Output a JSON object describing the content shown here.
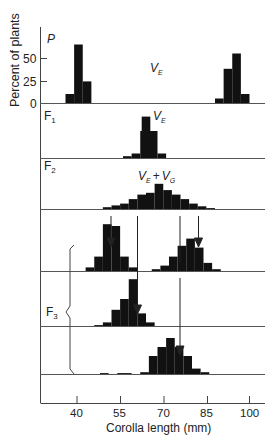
{
  "chart_data": {
    "type": "bar",
    "title": "",
    "xlabel": "Corolla length (mm)",
    "ylabel": "Percent of plants",
    "xlim": [
      21,
      106
    ],
    "x_ticks": [
      40,
      55,
      70,
      85,
      100
    ],
    "y_ticks": [
      0,
      25,
      50
    ],
    "y_scale_px_per_pct": 0.9,
    "colors": {
      "bars": "#111111",
      "axis": "#444444",
      "text": "#222222"
    },
    "panels": [
      {
        "label": "P",
        "annotation": "V_E",
        "annotation_pos": [
          66,
          68
        ],
        "baseline_y": 103,
        "series": [
          {
            "name": "P1",
            "bins": [
              [
                36,
                39,
                10
              ],
              [
                39,
                42,
                65
              ],
              [
                42,
                45,
                24
              ]
            ]
          },
          {
            "name": "P2",
            "bins": [
              [
                88,
                91,
                5
              ],
              [
                91,
                94,
                38
              ],
              [
                94,
                97,
                55
              ],
              [
                97,
                100,
                10
              ]
            ]
          }
        ]
      },
      {
        "label": "F1",
        "annotation": "V_E",
        "annotation_pos": [
          70,
          120
        ],
        "baseline_y": 158,
        "series": [
          {
            "name": "F1",
            "bins": [
              [
                56,
                59,
                2
              ],
              [
                59,
                62,
                5
              ],
              [
                62,
                65,
                30
              ],
              [
                65,
                68,
                30
              ],
              [
                68,
                71,
                5
              ]
            ]
          }
        ],
        "center_bin": [
          62.5,
          65.5,
          46
        ]
      },
      {
        "label": "F2",
        "annotation": "V_E + V_G",
        "annotation_pos": [
          66,
          172
        ],
        "baseline_y": 209,
        "series": [
          {
            "name": "F2",
            "bins": [
              [
                49,
                52,
                2
              ],
              [
                52,
                55,
                4
              ],
              [
                55,
                58,
                6
              ],
              [
                58,
                61,
                11
              ],
              [
                61,
                64,
                16
              ],
              [
                64,
                67,
                18
              ],
              [
                67,
                70,
                28
              ],
              [
                70,
                73,
                21
              ],
              [
                73,
                76,
                16
              ],
              [
                76,
                79,
                11
              ],
              [
                79,
                82,
                6
              ],
              [
                82,
                85,
                3
              ],
              [
                85,
                88,
                1
              ]
            ]
          }
        ]
      },
      {
        "label": "",
        "baseline_y": 271,
        "series": [
          {
            "name": "F3a-low",
            "bins": [
              [
                43,
                46,
                4
              ],
              [
                46,
                49,
                16
              ],
              [
                49,
                52,
                52
              ],
              [
                52,
                55,
                50
              ],
              [
                55,
                58,
                16
              ],
              [
                58,
                61,
                4
              ]
            ]
          },
          {
            "name": "F3a-high",
            "bins": [
              [
                66,
                69,
                2
              ],
              [
                69,
                72,
                6
              ],
              [
                72,
                75,
                16
              ],
              [
                75,
                78,
                28
              ],
              [
                78,
                81,
                36
              ],
              [
                81,
                84,
                26
              ],
              [
                84,
                87,
                9
              ],
              [
                87,
                90,
                2
              ]
            ]
          }
        ]
      },
      {
        "label": "F3",
        "baseline_y": 326,
        "series": [
          {
            "name": "F3b",
            "bins": [
              [
                46,
                49,
                1
              ],
              [
                49,
                52,
                4
              ],
              [
                52,
                55,
                18
              ],
              [
                55,
                58,
                30
              ],
              [
                58,
                61,
                52
              ],
              [
                61,
                64,
                14
              ],
              [
                64,
                67,
                4
              ]
            ]
          }
        ]
      },
      {
        "label": "",
        "baseline_y": 374,
        "series": [
          {
            "name": "F3c",
            "bins": [
              [
                48,
                51,
                1
              ],
              [
                54,
                59,
                1
              ],
              [
                62,
                65,
                2
              ],
              [
                65,
                68,
                20
              ],
              [
                68,
                71,
                30
              ],
              [
                71,
                74,
                40
              ],
              [
                74,
                77,
                30
              ],
              [
                77,
                80,
                20
              ],
              [
                80,
                83,
                6
              ],
              [
                83,
                86,
                2
              ]
            ]
          }
        ]
      }
    ],
    "arrows": [
      {
        "x": 50,
        "from_y": 215,
        "to_y": 244
      },
      {
        "x": 81,
        "from_y": 215,
        "to_y": 244
      },
      {
        "x": 59,
        "from_y": 215,
        "to_y": 313,
        "long": true
      },
      {
        "x": 75,
        "from_y": 215,
        "to_y": 263,
        "line_only": true
      },
      {
        "x": 75,
        "from_y": 278,
        "to_y": 355
      }
    ],
    "f3_bracket_label": "F3"
  },
  "labels": {
    "ylabel": "Percent of plants",
    "xlabel": "Corolla length (mm)",
    "p": "P",
    "f1": "F",
    "f1_sub": "1",
    "f2": "F",
    "f2_sub": "2",
    "f3": "F",
    "f3_sub": "3",
    "ve_p": "V",
    "ve_p_sub": "E",
    "ve_f1": "V",
    "ve_f1_sub": "E",
    "vevg_v1": "V",
    "vevg_s1": "E",
    "vevg_plus": "+",
    "vevg_v2": "V",
    "vevg_s2": "G",
    "ytick_50": "50",
    "ytick_25": "25",
    "ytick_0": "0",
    "xtick_40": "40",
    "xtick_55": "55",
    "xtick_70": "70",
    "xtick_85": "85",
    "xtick_100": "100"
  }
}
